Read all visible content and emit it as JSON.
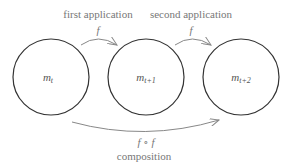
{
  "nodes": [
    {
      "id": "m_t",
      "base": "m",
      "sub": "t",
      "cx": 51,
      "cy": 77
    },
    {
      "id": "m_t+1",
      "base": "m",
      "sub": "t+1",
      "cx": 146,
      "cy": 77
    },
    {
      "id": "m_t+2",
      "base": "m",
      "sub": "t+2",
      "cx": 241,
      "cy": 77
    }
  ],
  "edges": [
    {
      "from": "m_t",
      "to": "m_t+1",
      "caption": "first application",
      "symbol": "f"
    },
    {
      "from": "m_t+1",
      "to": "m_t+2",
      "caption": "second application",
      "symbol": "f"
    },
    {
      "from": "m_t",
      "to": "m_t+2",
      "caption": "composition",
      "symbol": "f ∘ f"
    }
  ],
  "colors": {
    "circle_stroke": "#333333",
    "arrow": "#888888",
    "label": "#777777"
  }
}
